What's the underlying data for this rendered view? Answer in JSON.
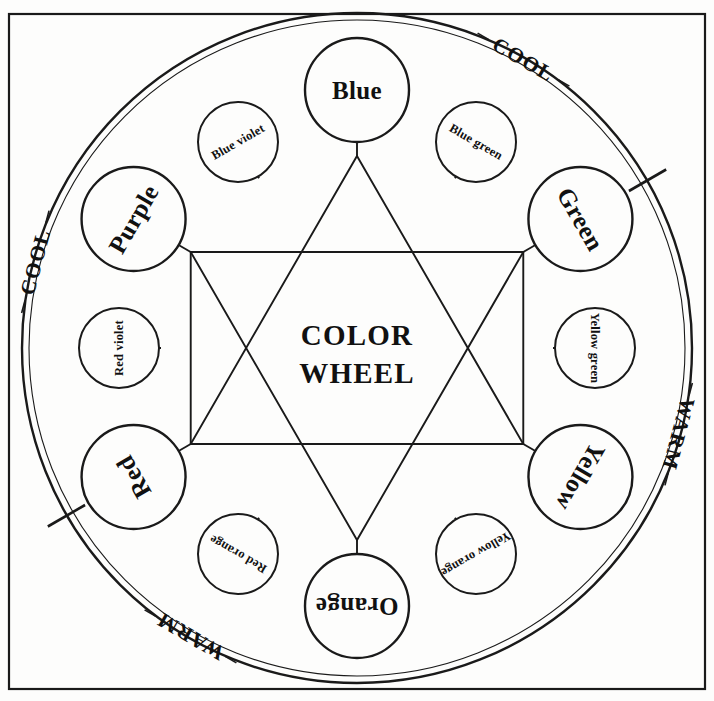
{
  "diagram": {
    "title_line1": "COLOR",
    "title_line2": "WHEEL",
    "frame": {
      "stroke": "#1a1a1a"
    }
  },
  "primary_nodes": [
    {
      "label": "Blue",
      "angle": -90,
      "rotation": 0
    },
    {
      "label": "Green",
      "angle": -30,
      "rotation": 60
    },
    {
      "label": "Yellow",
      "angle": 30,
      "rotation": 120
    },
    {
      "label": "Orange",
      "angle": 90,
      "rotation": 180
    },
    {
      "label": "Red",
      "angle": 150,
      "rotation": 240
    },
    {
      "label": "Purple",
      "angle": -150,
      "rotation": 300
    }
  ],
  "secondary_nodes": [
    {
      "label": "Blue green",
      "angle": -60,
      "rotation": 30
    },
    {
      "label": "Yellow green",
      "angle": 0,
      "rotation": 90
    },
    {
      "label": "Yellow orange",
      "angle": 60,
      "rotation": 150
    },
    {
      "label": "Red orange",
      "angle": 120,
      "rotation": 210
    },
    {
      "label": "Red violet",
      "angle": 180,
      "rotation": 270
    },
    {
      "label": "Blue violet",
      "angle": -120,
      "rotation": 330
    }
  ],
  "temperature_labels": [
    {
      "text": "COOL",
      "angle": -60,
      "rotation": 30
    },
    {
      "text": "COOL",
      "angle": -165,
      "rotation": 285
    },
    {
      "text": "WARM",
      "angle": 15,
      "rotation": 105
    },
    {
      "text": "WARM",
      "angle": 120,
      "rotation": 210
    }
  ],
  "ring_ticks": [
    {
      "angle": -30
    },
    {
      "angle": 150
    }
  ],
  "chart_data": {
    "type": "diagram",
    "primary_triad": [
      "Blue",
      "Yellow",
      "Red"
    ],
    "secondary_triad": [
      "Green",
      "Orange",
      "Purple"
    ],
    "tertiary": [
      "Blue green",
      "Yellow green",
      "Yellow orange",
      "Red orange",
      "Red violet",
      "Blue violet"
    ],
    "warm_half": [
      "Yellow",
      "Yellow orange",
      "Orange",
      "Red orange",
      "Red"
    ],
    "cool_half": [
      "Green",
      "Blue green",
      "Blue",
      "Blue violet",
      "Purple"
    ]
  }
}
